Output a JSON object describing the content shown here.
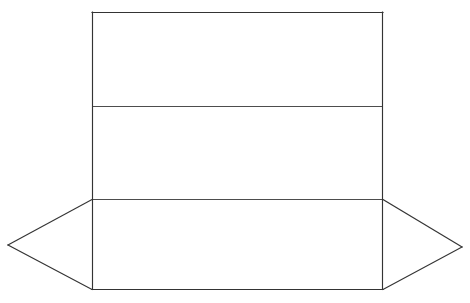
{
  "canvas": {
    "width": 470,
    "height": 303,
    "background_color": "#ffffff",
    "title": "Box Net Line Drawing"
  },
  "style": {
    "outline_color": "#343434",
    "fold_line_color": "#4d4d4d",
    "panel_fill_color": "#ffffff",
    "outline_width": 1.15,
    "fold_width": 1
  },
  "geometry": {
    "body_rect": {
      "left": 92,
      "top": 12,
      "right": 383,
      "bottom": 289,
      "width": 291,
      "height": 277
    },
    "fold_lines": [
      {
        "name": "upper-fold",
        "y": 106,
        "x1": 92,
        "x2": 383
      },
      {
        "name": "lower-fold",
        "y": 199,
        "x1": 92,
        "x2": 383
      }
    ],
    "left_flap_points": "92,199 8,245 92,289",
    "right_flap_points": "383,199 462,247 383,289",
    "left_tip": {
      "x": 8,
      "y": 245
    },
    "right_tip": {
      "x": 462,
      "y": 247
    },
    "body_outline_points": "92,12 383,12 383,289 92,289",
    "full_outline_points": "92,12 383,12 383,199 462,247 383,289 92,289 8,245 92,199"
  },
  "panels": [
    {
      "name": "top-panel",
      "label": "",
      "x": 92,
      "y": 12,
      "width": 291,
      "height": 94
    },
    {
      "name": "middle-panel",
      "label": "",
      "x": 92,
      "y": 106,
      "width": 291,
      "height": 93
    },
    {
      "name": "bottom-panel",
      "label": "",
      "x": 92,
      "y": 199,
      "width": 291,
      "height": 90
    }
  ],
  "flaps": [
    {
      "name": "left-flap",
      "label": "",
      "tip_x": 8,
      "tip_y": 245
    },
    {
      "name": "right-flap",
      "label": "",
      "tip_x": 462,
      "tip_y": 247
    }
  ],
  "annotations": [],
  "labels": []
}
